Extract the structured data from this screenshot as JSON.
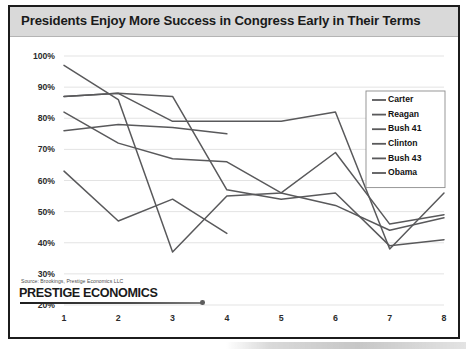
{
  "slide": {
    "title": "Presidents Enjoy More Success in Congress Early in Their Terms",
    "source": "Source: Brookings, Prestige Economics LLC",
    "logo": "PRESTIGE ECONOMICS"
  },
  "colors": {
    "title_bar": "#d9d9d9",
    "line": "#59595b",
    "grid": "#e3e3e3",
    "border": "#1c1c1c"
  },
  "chart_data": {
    "type": "line",
    "title": "Presidents Enjoy More Success in Congress Early in Their Terms",
    "xlabel": "",
    "ylabel": "",
    "x": [
      1,
      2,
      3,
      4,
      5,
      6,
      7,
      8
    ],
    "categories": [
      "1",
      "2",
      "3",
      "4",
      "5",
      "6",
      "7",
      "8"
    ],
    "xtick_labels": [
      "1",
      "2",
      "3",
      "4",
      "5",
      "6",
      "7",
      "8"
    ],
    "ytick_labels": [
      "100%",
      "90%",
      "80%",
      "70%",
      "60%",
      "50%",
      "40%",
      "30%",
      "20%"
    ],
    "yticks": [
      100,
      90,
      80,
      70,
      60,
      50,
      40,
      30,
      20
    ],
    "ylim": [
      20,
      100
    ],
    "xlim": [
      1,
      8
    ],
    "grid": true,
    "legend_position": "top-right",
    "value_suffix": "%",
    "series": [
      {
        "name": "Carter",
        "values": [
          76,
          78,
          77,
          75,
          null,
          null,
          null,
          null
        ]
      },
      {
        "name": "Reagan",
        "values": [
          82,
          72,
          67,
          66,
          56,
          52,
          44,
          48
        ]
      },
      {
        "name": "Bush 41",
        "values": [
          63,
          47,
          54,
          43,
          null,
          null,
          null,
          null
        ]
      },
      {
        "name": "Clinton",
        "values": [
          87,
          88,
          87,
          57,
          54,
          56,
          39,
          41
        ]
      },
      {
        "name": "Bush 43",
        "values": [
          87,
          88,
          79,
          79,
          79,
          82,
          38,
          56
        ]
      },
      {
        "name": "Obama",
        "values": [
          97,
          86,
          37,
          55,
          56,
          69,
          46,
          49
        ]
      }
    ]
  }
}
